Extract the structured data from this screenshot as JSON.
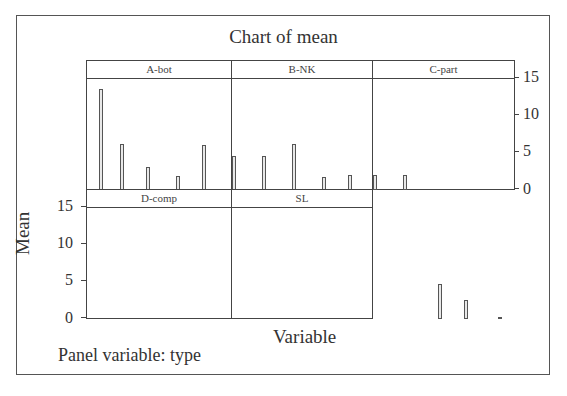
{
  "chart_data": {
    "type": "bar",
    "title": "Chart of mean",
    "xlabel": "Variable",
    "ylabel": "Mean",
    "footnote": "Panel variable: type",
    "ylim": [
      0,
      15
    ],
    "yticks": [
      0,
      5,
      10,
      15
    ],
    "grid": false,
    "layout": "paneled 2x3 (5 panels)",
    "panels": [
      {
        "name": "A-bot",
        "bars": [
          {
            "pos": 0.03,
            "value": 13.5
          }
        ]
      },
      {
        "name": "B-NK",
        "bars": [
          {
            "pos": 0.08,
            "value": 6.2
          },
          {
            "pos": 0.14,
            "value": 3.1
          },
          {
            "pos": 0.21,
            "value": 1.9
          },
          {
            "pos": 0.27,
            "value": 6.0
          },
          {
            "pos": 0.34,
            "value": 4.5
          },
          {
            "pos": 0.41,
            "value": 4.5
          }
        ]
      },
      {
        "name": "C-part",
        "bars": [
          {
            "pos": 0.48,
            "value": 6.2
          },
          {
            "pos": 0.55,
            "value": 1.7
          },
          {
            "pos": 0.61,
            "value": 2.0
          },
          {
            "pos": 0.67,
            "value": 2.0
          },
          {
            "pos": 0.74,
            "value": 2.0
          }
        ]
      },
      {
        "name": "D-comp",
        "bars": [
          {
            "pos": 0.82,
            "value": 4.7
          },
          {
            "pos": 0.88,
            "value": 2.5
          }
        ]
      },
      {
        "name": "SL",
        "bars": [
          {
            "pos": 0.96,
            "value": 0.2
          }
        ]
      }
    ]
  }
}
